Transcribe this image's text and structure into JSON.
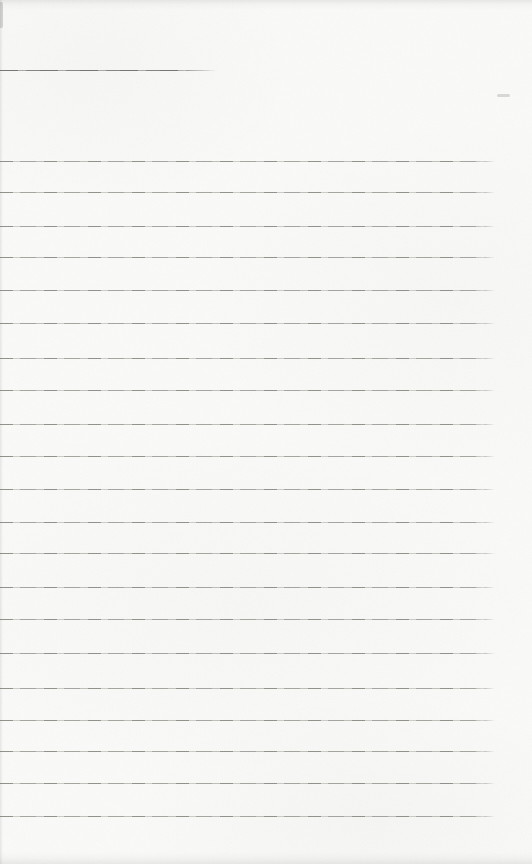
{
  "page": {
    "kind": "blank-ruled-notebook-page",
    "width_px": 532,
    "height_px": 864,
    "paper_color": "#fafaf8",
    "text_content": ""
  },
  "ruling": {
    "line_color": "#78786f",
    "line_thickness_px": 1,
    "x_start": 0,
    "x_end": 495,
    "line_ys": [
      161,
      192,
      226,
      257,
      290,
      323,
      358,
      390,
      424,
      456,
      489,
      522,
      553,
      587,
      619,
      653,
      688,
      720,
      751,
      783,
      816
    ],
    "line_count": 21,
    "avg_spacing_px": 32.75
  },
  "header_line": {
    "y": 70,
    "x_start": 0,
    "x_end": 217,
    "color": "#69696359"
  },
  "marks": {
    "faint_smudge": {
      "x": 497,
      "y": 94,
      "width": 13,
      "height": 3,
      "color": "rgba(140,140,134,0.30)"
    }
  },
  "edges": {
    "top_shade": "rgba(110,110,104,0.13)",
    "bottom_shade": "rgba(110,110,104,0.12)",
    "left_shade": "rgba(110,110,104,0.14)",
    "corner_notch": "rgba(90,90,85,0.22)"
  }
}
